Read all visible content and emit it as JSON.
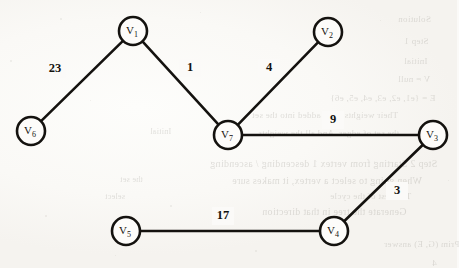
{
  "document": {
    "kind": "scanned-textbook-figure",
    "title": "Weighted undirected graph with seven vertices",
    "background_color": "#fbfaf8",
    "ink_color": "#14120f"
  },
  "graph": {
    "stroke_color": "#14120f",
    "node_fill": "#fdfcfa",
    "node_radius": 14,
    "nodes": [
      {
        "id": "V1",
        "base": "V",
        "sub": "1",
        "cx": 133,
        "cy": 31
      },
      {
        "id": "V2",
        "base": "V",
        "sub": "2",
        "cx": 328,
        "cy": 32
      },
      {
        "id": "V3",
        "base": "V",
        "sub": "3",
        "cx": 433,
        "cy": 135
      },
      {
        "id": "V4",
        "base": "V",
        "sub": "4",
        "cx": 334,
        "cy": 231
      },
      {
        "id": "V5",
        "base": "V",
        "sub": "5",
        "cx": 126,
        "cy": 231
      },
      {
        "id": "V6",
        "base": "V",
        "sub": "6",
        "cx": 31,
        "cy": 131
      },
      {
        "id": "V7",
        "base": "V",
        "sub": "7",
        "cx": 228,
        "cy": 135
      }
    ],
    "edges": [
      {
        "from": "V6",
        "to": "V1",
        "weight": "23",
        "label_x": 55,
        "label_y": 69
      },
      {
        "from": "V1",
        "to": "V7",
        "weight": "1",
        "label_x": 190,
        "label_y": 68
      },
      {
        "from": "V7",
        "to": "V2",
        "weight": "4",
        "label_x": 269,
        "label_y": 68
      },
      {
        "from": "V7",
        "to": "V3",
        "weight": "9",
        "label_x": 333,
        "label_y": 120
      },
      {
        "from": "V3",
        "to": "V4",
        "weight": "3",
        "label_x": 397,
        "label_y": 191
      },
      {
        "from": "V5",
        "to": "V4",
        "weight": "17",
        "label_x": 223,
        "label_y": 216
      }
    ]
  },
  "ghost_text": {
    "description": "faint mirrored show-through text from the reverse page",
    "lines": [
      {
        "text": "Solution",
        "x": 398,
        "y": 14,
        "size": 9
      },
      {
        "text": "Step 1",
        "x": 404,
        "y": 36,
        "size": 9
      },
      {
        "text": "Initial",
        "x": 404,
        "y": 56,
        "size": 9
      },
      {
        "text": "V = null",
        "x": 398,
        "y": 74,
        "size": 9
      },
      {
        "text": "E = {e1, e2, e3, e4, e5, e6}",
        "x": 330,
        "y": 93,
        "size": 9
      },
      {
        "text": "Their weights were added into the set",
        "x": 252,
        "y": 110,
        "size": 9
      },
      {
        "text": "the set of edges. And all the weights",
        "x": 258,
        "y": 128,
        "size": 9
      },
      {
        "text": "Step 2  Starting from vertex 1 descending / ascending",
        "x": 210,
        "y": 158,
        "size": 10
      },
      {
        "text": "When going to select a vertex, it makes sure",
        "x": 232,
        "y": 175,
        "size": 10
      },
      {
        "text": "The best of the cycle",
        "x": 330,
        "y": 191,
        "size": 9
      },
      {
        "text": "Generate the tree in that direction",
        "x": 262,
        "y": 206,
        "size": 10
      },
      {
        "text": "Prim (G, E) answer",
        "x": 384,
        "y": 239,
        "size": 9
      },
      {
        "text": "4",
        "x": 432,
        "y": 258,
        "size": 9
      },
      {
        "text": "Initial",
        "x": 150,
        "y": 127,
        "size": 8
      },
      {
        "text": "the set",
        "x": 120,
        "y": 175,
        "size": 8
      },
      {
        "text": "select",
        "x": 105,
        "y": 192,
        "size": 8
      }
    ]
  },
  "specks": [
    {
      "x": 60,
      "y": 18,
      "s": 2
    },
    {
      "x": 200,
      "y": 12,
      "s": 1
    },
    {
      "x": 300,
      "y": 60,
      "s": 2
    },
    {
      "x": 90,
      "y": 100,
      "s": 1
    },
    {
      "x": 170,
      "y": 205,
      "s": 2
    },
    {
      "x": 420,
      "y": 80,
      "s": 1
    },
    {
      "x": 45,
      "y": 215,
      "s": 2
    },
    {
      "x": 380,
      "y": 20,
      "s": 1
    },
    {
      "x": 255,
      "y": 250,
      "s": 2
    },
    {
      "x": 115,
      "y": 255,
      "s": 1
    },
    {
      "x": 10,
      "y": 60,
      "s": 2
    },
    {
      "x": 448,
      "y": 180,
      "s": 1
    }
  ]
}
